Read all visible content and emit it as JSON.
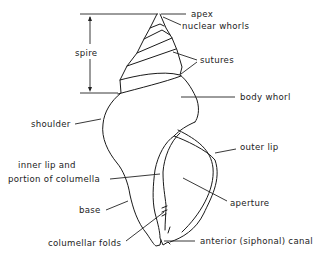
{
  "diagram": {
    "labels": {
      "apex": "apex",
      "nuclear_whorls": "nuclear whorls",
      "spire": "spire",
      "sutures": "sutures",
      "body_whorl": "body whorl",
      "shoulder": "shoulder",
      "outer_lip": "outer lip",
      "inner_lip_line1": "inner lip and",
      "inner_lip_line2": "portion of columella",
      "aperture": "aperture",
      "base": "base",
      "columellar_folds": "columellar folds",
      "anterior_canal": "anterior (siphonal) canal"
    },
    "colors": {
      "line": "#1a1a1a",
      "background": "#ffffff"
    }
  }
}
